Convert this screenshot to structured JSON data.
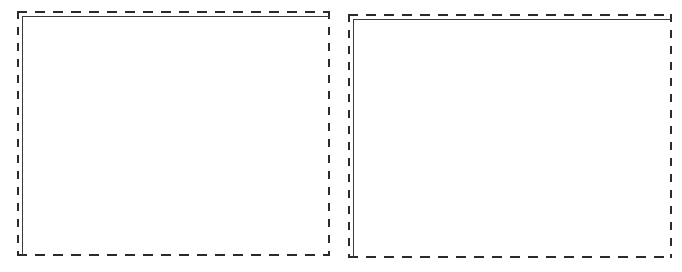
{
  "canvas": {
    "width": 682,
    "height": 272,
    "background_color": "#ffffff",
    "description": "Two blank placeholder content frames side by side"
  },
  "style": {
    "dash_color": "#2b2b2b",
    "rule_color": "#3a3a3a",
    "body_color": "#ffffff",
    "dash_h_length_px": 10,
    "dash_h_gap_px": 8,
    "dash_v_length_px": 8,
    "dash_v_gap_px": 8,
    "dash_thickness_px": 2,
    "rule_thickness_px": 1.5,
    "rule_inset_px": 5
  },
  "frames": [
    {
      "name": "left-frame",
      "label": "",
      "content": "",
      "x": 17,
      "y": 11,
      "width": 313,
      "height": 245,
      "dashed_border": true,
      "inner_rule_sides": "top-left",
      "empty": true
    },
    {
      "name": "right-frame",
      "label": "",
      "content": "",
      "x": 348,
      "y": 14,
      "width": 324,
      "height": 244,
      "dashed_border": true,
      "inner_rule_sides": "top-left",
      "empty": true
    }
  ]
}
